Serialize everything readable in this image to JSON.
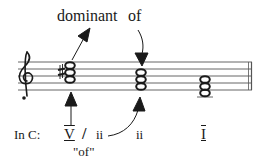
{
  "annotations": {
    "dominant": "dominant",
    "of_top": "of",
    "of_bottom": "\"of\""
  },
  "analysis": {
    "key_label": "In C:",
    "secondary_numeral": "V",
    "slash": "/",
    "secondary_target": "ii",
    "chord2_numeral": "ii",
    "chord3_numeral": "I"
  },
  "staff": {
    "clef": "treble",
    "chords": [
      {
        "name": "V/ii",
        "notes": [
          "A4",
          "C#5",
          "E5"
        ],
        "accidental": "sharp"
      },
      {
        "name": "ii",
        "notes": [
          "D4",
          "F4",
          "A4"
        ]
      },
      {
        "name": "I",
        "notes": [
          "C4",
          "E4",
          "G4"
        ]
      }
    ]
  }
}
